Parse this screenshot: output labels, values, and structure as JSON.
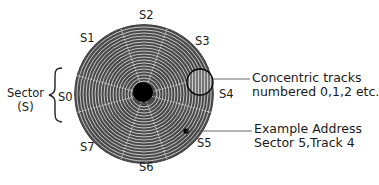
{
  "diagram": {
    "type": "disk-sector-track-layout",
    "sectors": [
      {
        "id": "S0",
        "label": "S0"
      },
      {
        "id": "S1",
        "label": "S1"
      },
      {
        "id": "S2",
        "label": "S2"
      },
      {
        "id": "S3",
        "label": "S3"
      },
      {
        "id": "S4",
        "label": "S4"
      },
      {
        "id": "S5",
        "label": "S5"
      },
      {
        "id": "S6",
        "label": "S6"
      },
      {
        "id": "S7",
        "label": "S7"
      }
    ],
    "sector_brace": {
      "line1": "Sector",
      "line2": "(S)"
    },
    "tracks_note": {
      "line1": "Concentric tracks",
      "line2": "numbered 0,1,2 etc."
    },
    "address_note": {
      "line1": "Example Address",
      "line2": "Sector 5,Track 4"
    },
    "colors": {
      "disk": "#5a5a5a",
      "track_line": "#d8d8d8",
      "hub": "#000000",
      "text": "#1a1a1a"
    }
  }
}
